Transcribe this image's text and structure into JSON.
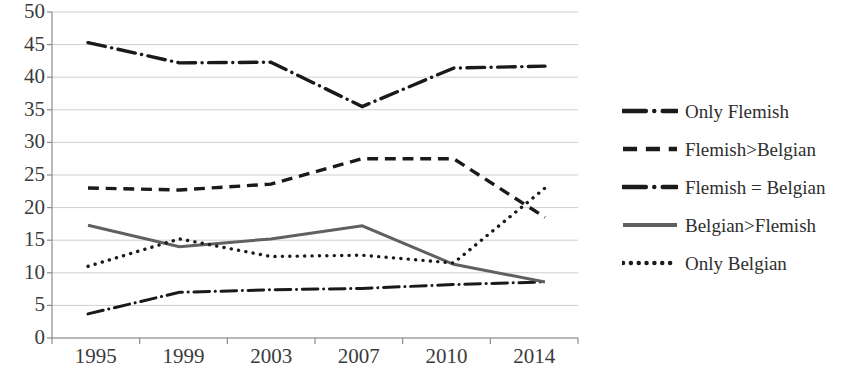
{
  "chart_data": {
    "type": "line",
    "title": "",
    "xlabel": "",
    "ylabel": "",
    "x": [
      "1995",
      "1999",
      "2003",
      "2007",
      "2010",
      "2014"
    ],
    "categories": [
      "1995",
      "1999",
      "2003",
      "2007",
      "2010",
      "2014"
    ],
    "yticks": [
      0,
      5,
      10,
      15,
      20,
      25,
      30,
      35,
      40,
      45,
      50
    ],
    "ytick_labels": [
      "0",
      "5",
      "10",
      "15",
      "20",
      "25",
      "30",
      "35",
      "40",
      "45",
      "50"
    ],
    "ylim": [
      0,
      50
    ],
    "grid": true,
    "legend_position": "right",
    "series": [
      {
        "name": "Only Flemish",
        "values": [
          45.3,
          42.2,
          42.3,
          35.5,
          41.4,
          41.7
        ],
        "style": "dash-dot",
        "color": "#1a1a1a",
        "width": 3.4
      },
      {
        "name": "Flemish>Belgian",
        "values": [
          23.0,
          22.7,
          23.6,
          27.5,
          27.5,
          18.5
        ],
        "style": "dashed",
        "color": "#1a1a1a",
        "width": 3.4
      },
      {
        "name": "Flemish = Belgian",
        "values": [
          3.7,
          7.0,
          7.4,
          7.6,
          8.2,
          8.6
        ],
        "style": "dash-dot",
        "color": "#1a1a1a",
        "width": 3.0
      },
      {
        "name": "Belgian>Flemish",
        "values": [
          17.3,
          14.0,
          15.2,
          17.2,
          11.3,
          8.6
        ],
        "style": "solid",
        "color": "#606060",
        "width": 3.0
      },
      {
        "name": "Only Belgian",
        "values": [
          11.0,
          15.2,
          12.5,
          12.7,
          11.5,
          23.0
        ],
        "style": "dotted",
        "color": "#1a1a1a",
        "width": 3.4
      }
    ]
  },
  "legend": {
    "items": [
      {
        "label": "Only Flemish",
        "key": "dash-dot-key"
      },
      {
        "label": "Flemish>Belgian",
        "key": "dashed-key"
      },
      {
        "label": "Flemish = Belgian",
        "key": "dash-dot-key"
      },
      {
        "label": "Belgian>Flemish",
        "key": "solid-gray-key"
      },
      {
        "label": "Only Belgian",
        "key": "dotted-key"
      }
    ]
  },
  "axes": {
    "gridline_color": "#cfcfcf",
    "axis_color": "#8c8c8c",
    "tick_text_color": "#3b3b3b"
  }
}
